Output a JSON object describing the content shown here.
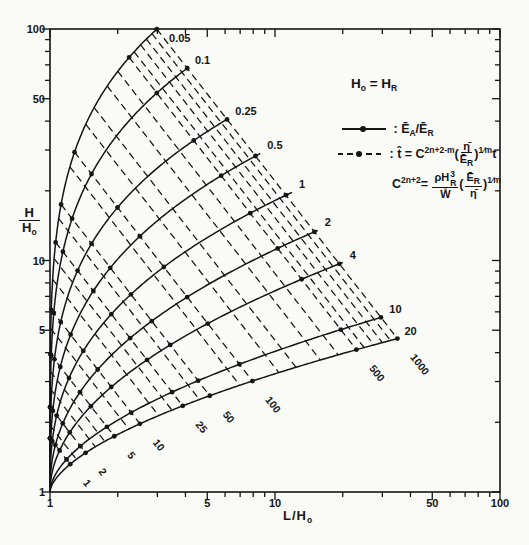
{
  "figure": {
    "ink": "#151515",
    "bg": "#fafaf7"
  },
  "axes": {
    "x_title": {
      "main": "L/H",
      "sub": "o"
    },
    "y_title": {
      "num": "H",
      "den": "H",
      "den_sub": "o"
    }
  },
  "legend": {
    "identity": {
      "h1": "H",
      "s1": "o",
      "eq": " = ",
      "h2": "H",
      "s2": "R"
    },
    "r1": {
      "colon": ": ",
      "e1": "Ē",
      "s1": "A",
      "slash": "/",
      "e2": "Ē",
      "s2": "R"
    },
    "r2": {
      "colon": ": ",
      "that": "t̂",
      "eq": " = ",
      "c": "C",
      "exp": "2n+2-m",
      "po": "(",
      "num": "η̄",
      "den_b": "Ē",
      "den_s": "R",
      "pc": ")",
      "exp2": "1⁄m",
      "t": "t"
    },
    "r3": {
      "c": "C",
      "exp": "2n+2",
      "eq": "= ",
      "n1": "ρH",
      "n1_sup": "3",
      "n1_sub": "R",
      "den": "W̊",
      "po": "(",
      "n2_b": "Ē",
      "n2_s": "R",
      "d2": "η̄",
      "pc": ")",
      "exp2": "1⁄m"
    }
  },
  "chart_data": {
    "type": "line",
    "x_scale": "log",
    "y_scale": "log",
    "xlim": [
      1,
      100
    ],
    "ylim": [
      1,
      100
    ],
    "xlabel": "L/Ho",
    "ylabel": "H/Ho",
    "grid": false,
    "x_major_ticks": [
      1,
      5,
      10,
      50,
      100
    ],
    "x_minor_ticks": [
      2,
      3,
      4,
      6,
      7,
      8,
      9,
      20,
      30,
      40,
      60,
      70,
      80,
      90
    ],
    "y_major_ticks": [
      1,
      5,
      10,
      50,
      100
    ],
    "y_minor_ticks": [
      2,
      3,
      4,
      6,
      7,
      8,
      9,
      20,
      30,
      40,
      60,
      70,
      80,
      90
    ],
    "origin": [
      1,
      1
    ],
    "solid_series_name": "ĒA/ĒR contours (solid, dot markers)",
    "dashed_series_name": "t̂ contours (dashed)",
    "solid_curves": [
      {
        "label": "0.05",
        "end": [
          2.99,
          100
        ],
        "p": 0.21
      },
      {
        "label": "0.1",
        "end": [
          4.1,
          68
        ],
        "p": 0.24
      },
      {
        "label": "0.25",
        "end": [
          6.2,
          41
        ],
        "p": 0.28
      },
      {
        "label": "0.5",
        "end": [
          8.6,
          29
        ],
        "p": 0.33
      },
      {
        "label": "1",
        "end": [
          11.9,
          19.7
        ],
        "p": 0.38
      },
      {
        "label": "2",
        "end": [
          15.5,
          13.5
        ],
        "p": 0.44
      },
      {
        "label": "4",
        "end": [
          20,
          9.8
        ],
        "p": 0.5
      },
      {
        "label": "10",
        "end": [
          30,
          5.7
        ],
        "p": 0.56
      },
      {
        "label": "20",
        "end": [
          35,
          4.6
        ],
        "p": 0.6
      }
    ],
    "dashed_labeled": [
      {
        "label": "1",
        "end_L": 1.23
      },
      {
        "label": "2",
        "end_L": 1.44
      },
      {
        "label": "5",
        "end_L": 1.93
      },
      {
        "label": "10",
        "end_L": 2.51
      },
      {
        "label": "25",
        "end_L": 3.89
      },
      {
        "label": "50",
        "end_L": 5.13
      },
      {
        "label": "100",
        "end_L": 7.94
      },
      {
        "label": "500",
        "end_L": 23.0
      },
      {
        "label": "1000",
        "end_L": 35.0
      }
    ],
    "dashed_minor_end_L": [
      1.31,
      1.59,
      1.75,
      2.24,
      3.04,
      3.48,
      4.61,
      6.97,
      10.4,
      12.4,
      15.9,
      19.1,
      24.9,
      27.5,
      30.0,
      32.6
    ],
    "dashed_slope_loglog": -1.25
  }
}
